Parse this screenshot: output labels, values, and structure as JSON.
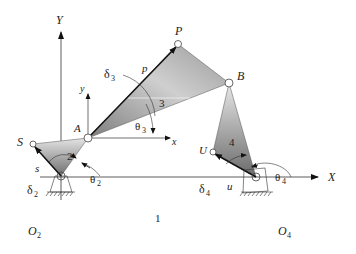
{
  "diagram": {
    "labels": {
      "Y_axis": "Y",
      "X_axis": "X",
      "local_y": "y",
      "local_x": "x",
      "P": "P",
      "B": "B",
      "A": "A",
      "S": "S",
      "U": "U",
      "O2": "O",
      "O2_sub": "2",
      "O4": "O",
      "O4_sub": "4",
      "p": "p",
      "s": "s",
      "u": "u",
      "link1": "1",
      "link2": "2",
      "link3": "3",
      "link4": "4",
      "delta3": "δ",
      "delta3_sub": "3",
      "theta3": "θ",
      "theta3_sub": "3",
      "delta2": "δ",
      "delta2_sub": "2",
      "theta2": "θ",
      "theta2_sub": "2",
      "delta4": "δ",
      "delta4_sub": "4",
      "theta4": "θ",
      "theta4_sub": "4"
    },
    "colors": {
      "link_dark": "#8a8a8a",
      "link_light": "#e6e6e6",
      "line": "#222222"
    }
  }
}
